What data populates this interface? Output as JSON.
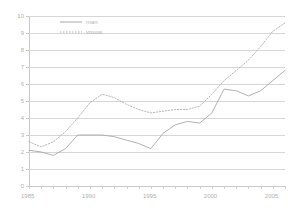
{
  "chart_data": {
    "type": "line",
    "title": "",
    "xlabel": "",
    "ylabel": "",
    "xlim": [
      1985,
      2006
    ],
    "ylim": [
      0,
      10
    ],
    "grid": true,
    "legend_position": "top-left-inside",
    "y_ticks": [
      0,
      1,
      2,
      3,
      4,
      5,
      6,
      7,
      8,
      9,
      10
    ],
    "y_tick_labels": [
      "0",
      "1",
      "2",
      "3",
      "4",
      "5",
      "6",
      "7",
      "8",
      "9",
      "10"
    ],
    "x_ticks": [
      1985,
      1990,
      1995,
      2000,
      2005
    ],
    "x_tick_labels": [
      "1985",
      "1990",
      "1995",
      "2000",
      "2005"
    ],
    "x_minor_ticks": [
      1985,
      1986,
      1987,
      1988,
      1989,
      1990,
      1991,
      1992,
      1993,
      1994,
      1995,
      1996,
      1997,
      1998,
      1999,
      2000,
      2001,
      2002,
      2003,
      2004,
      2005,
      2006
    ],
    "x": [
      1985,
      1986,
      1987,
      1988,
      1989,
      1990,
      1991,
      1992,
      1993,
      1994,
      1995,
      1996,
      1997,
      1998,
      1999,
      2000,
      2001,
      2002,
      2003,
      2004,
      2005,
      2006
    ],
    "series": [
      {
        "name": "man",
        "style": "solid",
        "color": "#a8a8a8",
        "values": [
          2.1,
          2.0,
          1.8,
          2.2,
          3.0,
          3.0,
          3.0,
          2.9,
          2.7,
          2.5,
          2.2,
          3.1,
          3.6,
          3.8,
          3.7,
          4.3,
          5.7,
          5.6,
          5.3,
          5.6,
          6.2,
          6.8
        ]
      },
      {
        "name": "vrouw",
        "style": "dotted",
        "color": "#b0b0b0",
        "values": [
          2.6,
          2.3,
          2.6,
          3.2,
          4.0,
          4.9,
          5.4,
          5.2,
          4.8,
          4.5,
          4.3,
          4.4,
          4.5,
          4.5,
          4.7,
          5.4,
          6.2,
          6.8,
          7.4,
          8.2,
          9.1,
          9.6
        ]
      }
    ]
  },
  "legend": {
    "items": [
      {
        "label": "man",
        "style": "solid"
      },
      {
        "label": "vrouw",
        "style": "dotted"
      }
    ]
  },
  "colors": {
    "grid": "#d6d6d6",
    "axis": "#c9c9c9",
    "text": "#b0b0b0",
    "series_man": "#a8a8a8",
    "series_vrouw": "#b0b0b0",
    "background": "#ffffff"
  }
}
